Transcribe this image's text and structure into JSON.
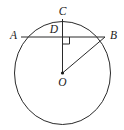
{
  "figure": {
    "type": "geometry-diagram",
    "background_color": "#ffffff",
    "stroke_color": "#2a2a2a",
    "label_color": "#1a1a1a",
    "labels": {
      "a": "A",
      "b": "B",
      "c": "C",
      "d": "D",
      "o": "O"
    },
    "points": {
      "a": {
        "x": 21.0,
        "y": 37.0,
        "name": "A",
        "on": "circle"
      },
      "b": {
        "x": 105.0,
        "y": 37.0,
        "name": "B",
        "on": "circle"
      },
      "c": {
        "x": 62.5,
        "y": 19.0,
        "name": "C",
        "on": "circle"
      },
      "d": {
        "x": 62.5,
        "y": 37.0,
        "name": "D",
        "on": "chord-AB"
      },
      "o": {
        "x": 62.5,
        "y": 73.0,
        "name": "O",
        "on": "center"
      }
    },
    "circle": {
      "center_x": 62.5,
      "center_y": 73.0,
      "radius_x": 48.0,
      "radius_y": 51.5
    },
    "segments": [
      {
        "name": "chord-ab",
        "from": "A",
        "to": "B"
      },
      {
        "name": "segment-cd-o",
        "from": "C",
        "to": "O"
      },
      {
        "name": "radius-ob",
        "from": "O",
        "to": "B"
      }
    ],
    "right_angle": {
      "at": "D",
      "size": 7.0,
      "orientation": "down-right"
    },
    "center_dot": {
      "radius": 1.6
    }
  }
}
